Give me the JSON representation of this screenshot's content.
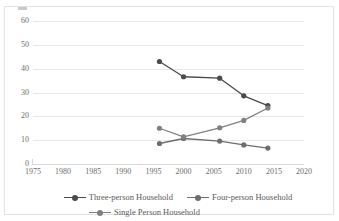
{
  "chart_data": {
    "type": "line",
    "title": "",
    "subtitle": "",
    "xlabel": "",
    "ylabel": "",
    "xlim": [
      1975,
      2020
    ],
    "ylim": [
      0,
      60
    ],
    "grid": true,
    "legend_position": "bottom",
    "x_ticks": [
      1975,
      1980,
      1985,
      1990,
      1995,
      2000,
      2005,
      2010,
      2015,
      2020
    ],
    "y_ticks": [
      0,
      10,
      20,
      30,
      40,
      50,
      60
    ],
    "series": [
      {
        "name": "Three-person Household",
        "color": "#4a4a4a",
        "points": [
          {
            "x": 1996,
            "y": 43.0
          },
          {
            "x": 2000,
            "y": 36.6
          },
          {
            "x": 2006,
            "y": 36.0
          },
          {
            "x": 2010,
            "y": 28.6
          },
          {
            "x": 2014,
            "y": 24.5
          }
        ]
      },
      {
        "name": "Four-person Household",
        "color": "#6e6e6e",
        "points": [
          {
            "x": 1996,
            "y": 8.6
          },
          {
            "x": 2000,
            "y": 10.7
          },
          {
            "x": 2006,
            "y": 9.6
          },
          {
            "x": 2010,
            "y": 8.0
          },
          {
            "x": 2014,
            "y": 6.7
          }
        ]
      },
      {
        "name": "Single Person Household",
        "color": "#808080",
        "points": [
          {
            "x": 1996,
            "y": 15.0
          },
          {
            "x": 2000,
            "y": 11.4
          },
          {
            "x": 2006,
            "y": 15.2
          },
          {
            "x": 2010,
            "y": 18.3
          },
          {
            "x": 2014,
            "y": 23.5
          }
        ]
      }
    ]
  },
  "legend": {
    "rows": [
      [
        "Three-person Household",
        "Four-person Household"
      ],
      [
        "Single Person Household"
      ]
    ]
  }
}
